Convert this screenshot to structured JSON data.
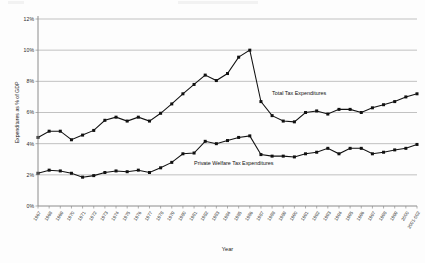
{
  "chart_data": {
    "type": "line",
    "title": "",
    "xlabel": "Year",
    "ylabel": "Expenditures as % of GDP",
    "ylim": [
      0,
      12
    ],
    "yticks": [
      0,
      2,
      4,
      6,
      8,
      10,
      12
    ],
    "ytick_labels": [
      "0%",
      "2%",
      "4%",
      "6%",
      "8%",
      "10%",
      "12%"
    ],
    "grid": true,
    "legend_position": "inline-annotations",
    "categories": [
      "1967",
      "1968",
      "1969",
      "1970",
      "1971",
      "1972",
      "1973",
      "1974",
      "1975",
      "1976",
      "1977",
      "1978",
      "1979",
      "1980",
      "1981",
      "1982",
      "1983",
      "1984",
      "1985",
      "1986",
      "1987",
      "1988",
      "1989",
      "1990",
      "1991",
      "1992",
      "1993",
      "1994",
      "1995",
      "1996",
      "1997",
      "1998",
      "1999",
      "2000",
      "2001-002"
    ],
    "series": [
      {
        "name": "Total Tax Expenditures",
        "values": [
          4.4,
          4.8,
          4.8,
          4.25,
          4.55,
          4.85,
          5.5,
          5.7,
          5.45,
          5.7,
          5.45,
          5.95,
          6.55,
          7.2,
          7.8,
          8.4,
          8.05,
          8.5,
          9.55,
          10.0,
          6.7,
          5.8,
          5.45,
          5.4,
          6.0,
          6.1,
          5.9,
          6.2,
          6.2,
          6.0,
          6.3,
          6.5,
          6.7,
          7.0,
          7.2
        ]
      },
      {
        "name": "Private Welfare Tax Expenditures",
        "values": [
          2.1,
          2.3,
          2.25,
          2.1,
          1.85,
          1.95,
          2.15,
          2.25,
          2.2,
          2.3,
          2.15,
          2.45,
          2.8,
          3.35,
          3.4,
          4.15,
          4.0,
          4.2,
          4.4,
          4.5,
          3.3,
          3.2,
          3.2,
          3.15,
          3.35,
          3.45,
          3.7,
          3.35,
          3.7,
          3.7,
          3.35,
          3.45,
          3.6,
          3.7,
          3.95
        ]
      }
    ],
    "annotations": [
      {
        "text": "Total Tax Expenditures",
        "x_category": "1988",
        "y_value": 7.1
      },
      {
        "text": "Private Welfare Tax Expenditures",
        "x_category": "1981",
        "y_value": 2.6
      }
    ]
  },
  "colors": {
    "series_line": "#111111",
    "grid": "#a8a8a8",
    "axis": "#8c8c8c",
    "background": "#fdfdfd"
  }
}
